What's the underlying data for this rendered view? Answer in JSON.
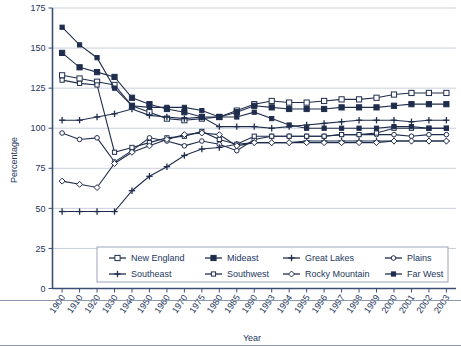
{
  "chart_data": {
    "type": "line",
    "title": "",
    "xlabel": "Year",
    "ylabel": "Percentage",
    "ylim": [
      0,
      175
    ],
    "ytick_step": 25,
    "yticks": [
      "0",
      "25",
      "50",
      "75",
      "100",
      "125",
      "150",
      "175"
    ],
    "grid": true,
    "legend_position": "bottom-inside",
    "categories": [
      "1900",
      "1910",
      "1920",
      "1930",
      "1940",
      "1950",
      "1960",
      "1970",
      "1975",
      "1980",
      "1985",
      "1990",
      "1993",
      "1994",
      "1995",
      "1996",
      "1997",
      "1998",
      "1999",
      "2000",
      "2001",
      "2002",
      "2003"
    ],
    "series": [
      {
        "name": "New England",
        "marker": "open-square",
        "values": [
          133,
          131,
          129,
          127,
          114,
          110,
          106,
          105,
          106,
          107,
          111,
          115,
          117,
          116,
          116,
          117,
          118,
          118,
          119,
          121,
          122,
          122,
          122
        ]
      },
      {
        "name": "Mideast",
        "marker": "filled-square",
        "values": [
          147,
          138,
          135,
          132,
          119,
          115,
          112,
          110,
          107,
          107,
          110,
          114,
          113,
          112,
          112,
          112,
          113,
          113,
          113,
          114,
          115,
          115,
          115
        ]
      },
      {
        "name": "Great Lakes",
        "marker": "filled-plus",
        "values": [
          105,
          105,
          107,
          109,
          112,
          108,
          107,
          106,
          107,
          101,
          101,
          101,
          100,
          101,
          102,
          103,
          104,
          105,
          105,
          105,
          104,
          105,
          105
        ]
      },
      {
        "name": "Plains",
        "marker": "open-circle",
        "values": [
          97,
          93,
          94,
          79,
          86,
          94,
          92,
          89,
          92,
          90,
          86,
          93,
          95,
          95,
          95,
          95,
          96,
          96,
          96,
          96,
          95,
          96,
          96
        ]
      },
      {
        "name": "Southeast",
        "marker": "filled-cross",
        "values": [
          48,
          48,
          48,
          48,
          61,
          70,
          76,
          83,
          87,
          88,
          90,
          91,
          91,
          91,
          92,
          92,
          92,
          92,
          92,
          92,
          92,
          92,
          92
        ]
      },
      {
        "name": "Southwest",
        "marker": "open-square-small",
        "values": [
          130,
          128,
          127,
          85,
          88,
          91,
          94,
          95,
          98,
          93,
          90,
          95,
          95,
          95,
          95,
          95,
          96,
          96,
          97,
          100,
          100,
          100,
          100
        ]
      },
      {
        "name": "Rocky Mountain",
        "marker": "open-diamond",
        "values": [
          67,
          65,
          63,
          78,
          85,
          89,
          93,
          96,
          97,
          96,
          89,
          91,
          91,
          91,
          91,
          91,
          91,
          91,
          91,
          92,
          92,
          92,
          92
        ]
      },
      {
        "name": "Far West",
        "marker": "filled-square-small",
        "values": [
          163,
          152,
          144,
          125,
          114,
          113,
          113,
          113,
          111,
          107,
          107,
          110,
          106,
          102,
          100,
          100,
          100,
          100,
          100,
          101,
          101,
          100,
          100
        ]
      }
    ]
  },
  "legend": {
    "items": [
      {
        "label": "New England"
      },
      {
        "label": "Mideast"
      },
      {
        "label": "Great Lakes"
      },
      {
        "label": "Plains"
      },
      {
        "label": "Southeast"
      },
      {
        "label": "Southwest"
      },
      {
        "label": "Rocky Mountain"
      },
      {
        "label": "Far West"
      }
    ]
  },
  "colors": {
    "series": "#1f2d4d",
    "grid": "#c9cfdd",
    "axis": "#3c4f73",
    "text": "#23365c",
    "background": "#ffffff"
  }
}
